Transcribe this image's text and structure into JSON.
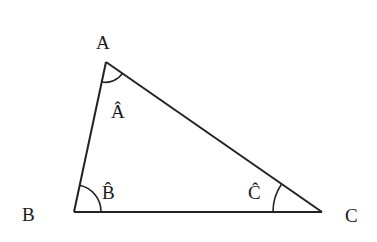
{
  "diagram": {
    "vertices": [
      {
        "id": "A",
        "label": "A",
        "x": 106,
        "y": 62,
        "label_x": 104,
        "label_y": 49
      },
      {
        "id": "B",
        "label": "B",
        "x": 74,
        "y": 212,
        "label_x": 30,
        "label_y": 221
      },
      {
        "id": "C",
        "label": "C",
        "x": 322,
        "y": 212,
        "label_x": 354,
        "label_y": 222
      }
    ],
    "angles": [
      {
        "vertex": "A",
        "label": "Â",
        "label_x": 119,
        "label_y": 118
      },
      {
        "vertex": "B",
        "label": "B̂",
        "label_x": 110,
        "label_y": 200
      },
      {
        "vertex": "C",
        "label": "Ĉ",
        "label_x": 256,
        "label_y": 200
      }
    ],
    "stroke_color": "#222222"
  }
}
